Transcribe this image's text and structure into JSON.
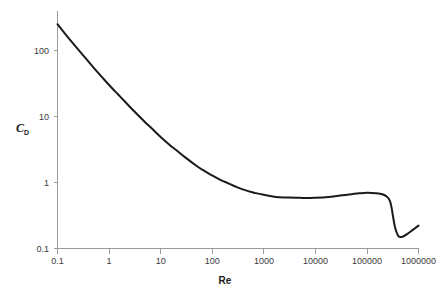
{
  "chart_data": {
    "type": "line",
    "title": "",
    "xlabel": "Re",
    "ylabel": "C_D",
    "ylabel_base": "C",
    "ylabel_sub": "D",
    "xscale": "log",
    "yscale": "log",
    "xlim": [
      0.1,
      1000000
    ],
    "ylim": [
      0.1,
      300
    ],
    "grid": false,
    "legend": null,
    "xticks": [
      0.1,
      1,
      10,
      100,
      1000,
      10000,
      100000,
      1000000
    ],
    "xtick_labels": [
      "0.1",
      "1",
      "10",
      "100",
      "1000",
      "10000",
      "100000",
      "1000000"
    ],
    "yticks": [
      0.1,
      1,
      10,
      100
    ],
    "ytick_labels": [
      "0.1",
      "1",
      "10",
      "100"
    ],
    "series": [
      {
        "name": "Sphere drag coefficient",
        "color": "#1a1a1a",
        "x": [
          0.1,
          0.15,
          0.2,
          0.3,
          0.5,
          0.7,
          1,
          1.5,
          2,
          3,
          5,
          7,
          10,
          15,
          20,
          30,
          50,
          70,
          100,
          150,
          200,
          300,
          500,
          700,
          1000,
          1500,
          2000,
          3000,
          5000,
          7000,
          10000,
          20000,
          30000,
          50000,
          70000,
          100000,
          150000,
          200000,
          250000,
          280000,
          300000,
          320000,
          350000,
          400000,
          450000,
          500000,
          600000,
          800000,
          1000000
        ],
        "y": [
          250,
          168,
          128,
          88,
          55,
          41,
          30,
          21.5,
          17,
          12.2,
          8.2,
          6.4,
          4.9,
          3.7,
          3.1,
          2.4,
          1.78,
          1.5,
          1.28,
          1.08,
          0.98,
          0.85,
          0.74,
          0.69,
          0.65,
          0.615,
          0.6,
          0.59,
          0.585,
          0.582,
          0.585,
          0.61,
          0.635,
          0.665,
          0.685,
          0.7,
          0.69,
          0.665,
          0.6,
          0.52,
          0.42,
          0.31,
          0.21,
          0.158,
          0.149,
          0.152,
          0.165,
          0.195,
          0.222
        ]
      }
    ]
  },
  "axes": {
    "x_axis_name": "reynolds-number-axis",
    "y_axis_name": "drag-coefficient-axis"
  }
}
